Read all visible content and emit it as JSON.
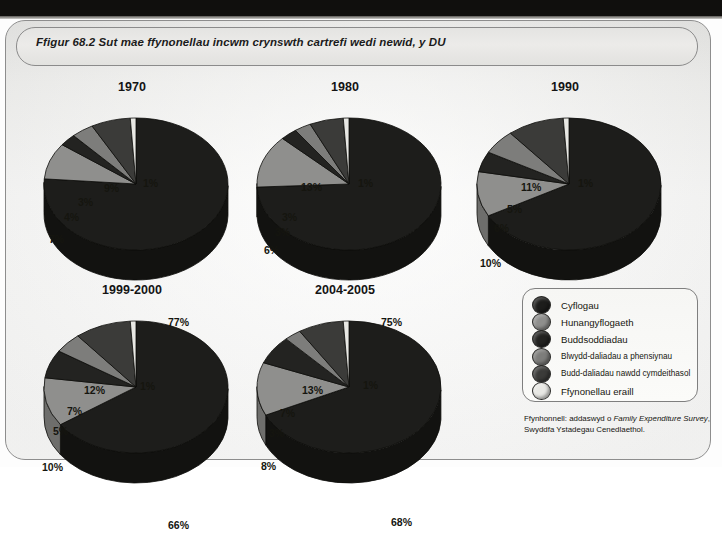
{
  "figure": {
    "title": "Ffigur 68.2 Sut mae ffynonellau incwm crynswth cartrefi wedi newid, y DU",
    "source_line1_pre": "Ffynhonnell: addaswyd o ",
    "source_line1_italic": "Family Expenditure",
    "source_line2_italic": "Survey",
    "source_line2_post": ", Swyddfa Ystadegau Cenedlaethol."
  },
  "legend": {
    "items": [
      {
        "label": "Cyflogau",
        "color": "#1d1d1b",
        "small": false
      },
      {
        "label": "Hunangyflogaeth",
        "color": "#8f8f8d",
        "small": false
      },
      {
        "label": "Buddsoddiadau",
        "color": "#232321",
        "small": false
      },
      {
        "label": "Blwydd-daliadau a phensiynau",
        "color": "#7d7d7b",
        "small": true
      },
      {
        "label": "Budd-daliadau nawdd cymdeithasol",
        "color": "#3b3b39",
        "small": true
      },
      {
        "label": "Ffynonellau eraill",
        "color": "#e8e8e4",
        "small": false
      }
    ]
  },
  "chart_data": [
    {
      "type": "pie",
      "title": "1970",
      "categories": [
        "Cyflogau",
        "Hunangyflogaeth",
        "Buddsoddiadau",
        "Blwydd-daliadau a phensiynau",
        "Budd-daliadau nawdd cymdeithasol",
        "Ffynonellau eraill"
      ],
      "values": [
        77,
        9,
        3,
        4,
        7,
        1
      ],
      "labels": [
        "77%",
        "9%",
        "3%",
        "4%",
        "7%",
        "1%"
      ]
    },
    {
      "type": "pie",
      "title": "1980",
      "categories": [
        "Cyflogau",
        "Hunangyflogaeth",
        "Buddsoddiadau",
        "Blwydd-daliadau a phensiynau",
        "Budd-daliadau nawdd cymdeithasol",
        "Ffynonellau eraill"
      ],
      "values": [
        75,
        13,
        3,
        3,
        6,
        1
      ],
      "labels": [
        "75%",
        "13%",
        "3%",
        "3%",
        "6%",
        "1%"
      ]
    },
    {
      "type": "pie",
      "title": "1990",
      "categories": [
        "Cyflogau",
        "Hunangyflogaeth",
        "Buddsoddiadau",
        "Blwydd-daliadau a phensiynau",
        "Budd-daliadau nawdd cymdeithasol",
        "Ffynonellau eraill"
      ],
      "values": [
        67,
        11,
        5,
        6,
        10,
        1
      ],
      "labels": [
        "67%",
        "11%",
        "5%",
        "6%",
        "10%",
        "1%"
      ]
    },
    {
      "type": "pie",
      "title": "1999-2000",
      "categories": [
        "Cyflogau",
        "Hunangyflogaeth",
        "Buddsoddiadau",
        "Blwydd-daliadau a phensiynau",
        "Budd-daliadau nawdd cymdeithasol",
        "Ffynonellau eraill"
      ],
      "values": [
        66,
        12,
        7,
        5,
        10,
        1
      ],
      "labels": [
        "66%",
        "12%",
        "7%",
        "5%",
        "10%",
        "1%"
      ]
    },
    {
      "type": "pie",
      "title": "2004-2005",
      "categories": [
        "Cyflogau",
        "Hunangyflogaeth",
        "Buddsoddiadau",
        "Blwydd-daliadau a phensiynau",
        "Budd-daliadau nawdd cymdeithasol",
        "Ffynonellau eraill"
      ],
      "values": [
        68,
        13,
        7,
        3,
        8,
        1
      ],
      "labels": [
        "68%",
        "13%",
        "7%",
        "3%",
        "8%",
        "1%"
      ]
    }
  ]
}
